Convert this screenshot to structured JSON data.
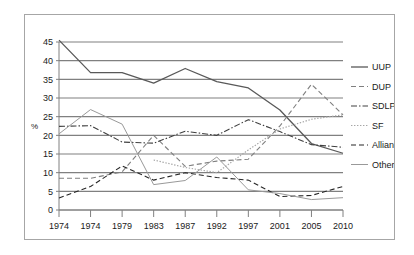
{
  "chart_data": {
    "type": "line",
    "title": "",
    "subtitle": "",
    "xlabel": "",
    "ylabel": "%",
    "ylim": [
      0,
      45
    ],
    "ytick_step": 5,
    "yticks": [
      "0",
      "5",
      "10",
      "15",
      "20",
      "25",
      "30",
      "35",
      "40",
      "45"
    ],
    "grid": true,
    "grid_axis": "y",
    "legend_position": "right",
    "categories": [
      "1974",
      "1974",
      "1979",
      "1983",
      "1987",
      "1992",
      "1997",
      "2001",
      "2005",
      "2010"
    ],
    "series": [
      {
        "name": "UUP",
        "style": "solid",
        "color": "#595959",
        "values": [
          45.5,
          36.8,
          36.8,
          34.0,
          37.9,
          34.4,
          32.7,
          26.8,
          17.8,
          15.2
        ]
      },
      {
        "name": "DUP",
        "style": "dashed",
        "color": "#7f7f7f",
        "values": [
          8.5,
          8.5,
          10.2,
          20.0,
          11.7,
          13.1,
          13.6,
          22.5,
          33.7,
          25.5
        ]
      },
      {
        "name": "SDLP",
        "style": "dash-dot",
        "color": "#404040",
        "values": [
          22.4,
          22.6,
          18.2,
          17.9,
          21.1,
          20.0,
          24.2,
          21.0,
          17.5,
          16.8
        ]
      },
      {
        "name": "SF",
        "style": "dotted",
        "color": "#a6a6a6",
        "values": [
          null,
          null,
          null,
          13.4,
          11.4,
          10.0,
          16.1,
          21.7,
          24.3,
          25.5
        ]
      },
      {
        "name": "Alliance",
        "style": "dashed",
        "color": "#262626",
        "values": [
          3.2,
          6.3,
          11.8,
          8.0,
          10.0,
          8.7,
          8.0,
          3.6,
          3.9,
          6.3
        ]
      },
      {
        "name": "Other",
        "style": "thin-solid",
        "color": "#999999",
        "values": [
          20.4,
          26.9,
          23.0,
          6.8,
          7.9,
          14.2,
          5.4,
          4.4,
          2.8,
          3.3
        ]
      }
    ]
  },
  "legend": {
    "entries": [
      {
        "label": "UUP"
      },
      {
        "label": "DUP"
      },
      {
        "label": "SDLP"
      },
      {
        "label": "SF"
      },
      {
        "label": "Alliance"
      },
      {
        "label": "Other"
      }
    ]
  },
  "colors": {
    "frame_border": "#a6a6a6",
    "gridline": "#808080",
    "axis": "#808080",
    "background": "#ffffff",
    "text": "#1a1a1a"
  }
}
